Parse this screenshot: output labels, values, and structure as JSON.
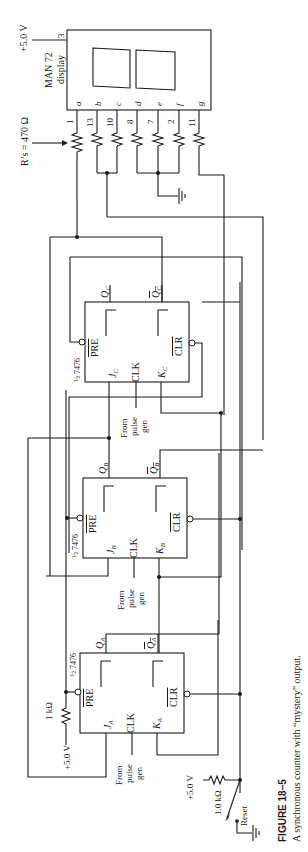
{
  "figure": {
    "number_label": "FIGURE 18–5",
    "caption": "A synchronous counter with “mystery” output."
  },
  "display": {
    "name_line1": "MAN 72",
    "name_line2": "display",
    "supply_label": "+5.0 V",
    "supply_pin": "3",
    "segments": [
      "a",
      "b",
      "c",
      "d",
      "e",
      "f",
      "g"
    ],
    "pins": [
      "1",
      "13",
      "10",
      "8",
      "7",
      "2",
      "11"
    ]
  },
  "resistors": {
    "segment_label": "R’s = 470 Ω",
    "pullup_label": "1 kΩ",
    "pullup_supply": "+5.0 V",
    "reset_resistor": "1.0 kΩ",
    "reset_supply": "+5.0 V",
    "reset_switch": "Reset"
  },
  "flipflops": [
    {
      "id": "A",
      "chip": "½ 7476",
      "pre": "PRE",
      "clr": "CLR",
      "clk": "CLK",
      "j": "J",
      "k": "K",
      "q": "Q",
      "qbar": "Q",
      "sub": "A",
      "clock_src": [
        "From",
        "pulse",
        "gen"
      ]
    },
    {
      "id": "B",
      "chip": "½ 7476",
      "pre": "PRE",
      "clr": "CLR",
      "clk": "CLK",
      "j": "J",
      "k": "K",
      "q": "Q",
      "qbar": "Q",
      "sub": "B",
      "clock_src": [
        "From",
        "pulse",
        "gen"
      ]
    },
    {
      "id": "C",
      "chip": "½ 7476",
      "pre": "PRE",
      "clr": "CLR",
      "clk": "CLK",
      "j": "J",
      "k": "K",
      "q": "Q",
      "qbar": "Q",
      "sub": "C",
      "clock_src": [
        "From",
        "pulse",
        "gen"
      ]
    }
  ]
}
